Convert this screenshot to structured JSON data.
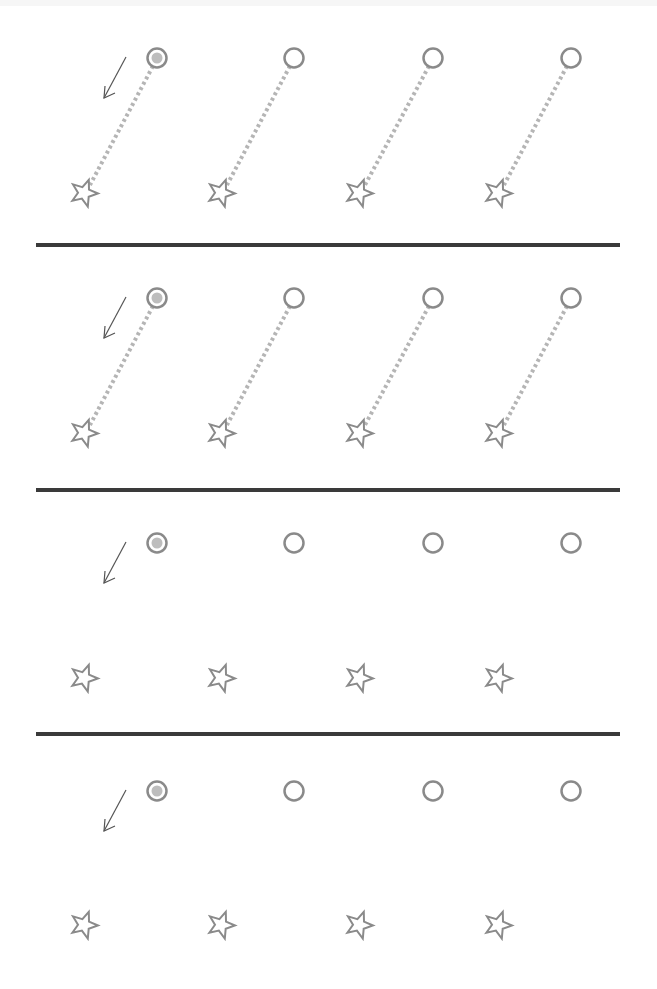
{
  "worksheet": {
    "type": "tracing-practice",
    "colors": {
      "shape_stroke": "#8a8a8a",
      "start_fill": "#bdbdbd",
      "dotted_line": "#b5b5b5",
      "arrow": "#555555",
      "divider": "#3a3a3a"
    },
    "rows": [
      {
        "index": 1,
        "guide_lines": true,
        "pairs": [
          {
            "start": "circle-filled",
            "end": "star",
            "circle": [
              157,
              58
            ],
            "star": [
              84,
              193
            ]
          },
          {
            "start": "circle",
            "end": "star",
            "circle": [
              294,
              58
            ],
            "star": [
              221,
              193
            ]
          },
          {
            "start": "circle",
            "end": "star",
            "circle": [
              433,
              58
            ],
            "star": [
              359,
              193
            ]
          },
          {
            "start": "circle",
            "end": "star",
            "circle": [
              571,
              58
            ],
            "star": [
              498,
              193
            ]
          }
        ],
        "arrow": {
          "from": [
            126,
            84
          ],
          "to": [
            104,
            97
          ]
        }
      },
      {
        "index": 2,
        "guide_lines": true,
        "pairs": [
          {
            "start": "circle-filled",
            "end": "star",
            "circle": [
              157,
              298
            ],
            "star": [
              84,
              433
            ]
          },
          {
            "start": "circle",
            "end": "star",
            "circle": [
              294,
              298
            ],
            "star": [
              221,
              433
            ]
          },
          {
            "start": "circle",
            "end": "star",
            "circle": [
              433,
              298
            ],
            "star": [
              359,
              433
            ]
          },
          {
            "start": "circle",
            "end": "star",
            "circle": [
              571,
              298
            ],
            "star": [
              498,
              433
            ]
          }
        ],
        "arrow": {
          "from": [
            126,
            324
          ],
          "to": [
            104,
            337
          ]
        }
      },
      {
        "index": 3,
        "guide_lines": false,
        "pairs": [
          {
            "start": "circle-filled",
            "end": "star",
            "circle": [
              157,
              543
            ],
            "star": [
              84,
              678
            ]
          },
          {
            "start": "circle",
            "end": "star",
            "circle": [
              294,
              543
            ],
            "star": [
              221,
              678
            ]
          },
          {
            "start": "circle",
            "end": "star",
            "circle": [
              433,
              543
            ],
            "star": [
              359,
              678
            ]
          },
          {
            "start": "circle",
            "end": "star",
            "circle": [
              571,
              543
            ],
            "star": [
              498,
              678
            ]
          }
        ],
        "arrow": {
          "from": [
            126,
            569
          ],
          "to": [
            104,
            582
          ]
        }
      },
      {
        "index": 4,
        "guide_lines": false,
        "pairs": [
          {
            "start": "circle-filled",
            "end": "star",
            "circle": [
              157,
              791
            ],
            "star": [
              84,
              925
            ]
          },
          {
            "start": "circle",
            "end": "star",
            "circle": [
              294,
              791
            ],
            "star": [
              221,
              925
            ]
          },
          {
            "start": "circle",
            "end": "star",
            "circle": [
              433,
              791
            ],
            "star": [
              359,
              925
            ]
          },
          {
            "start": "circle",
            "end": "star",
            "circle": [
              571,
              791
            ],
            "star": [
              498,
              925
            ]
          }
        ],
        "arrow": {
          "from": [
            126,
            817
          ],
          "to": [
            104,
            830
          ]
        }
      }
    ],
    "dividers_y": [
      245,
      490,
      734
    ]
  }
}
